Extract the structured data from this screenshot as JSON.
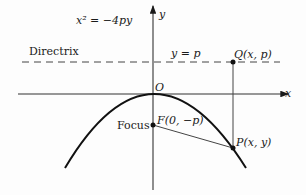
{
  "diagram": {
    "equation": "x² = −4py",
    "directrix_label": "Directrix",
    "directrix_equation": "y = p",
    "axis_x_label": "x",
    "axis_y_label": "y",
    "origin_label": "O",
    "focus_word": "Focus",
    "focus_point_label": "F(0, −p)",
    "point_q_label": "Q(x, p)",
    "point_p_label": "P(x, y)"
  },
  "colors": {
    "stroke": "#1a1a1a",
    "axis": "#333333",
    "background": "#fdfdfd"
  }
}
